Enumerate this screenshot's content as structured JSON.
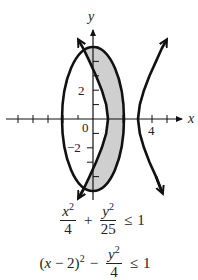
{
  "figure": {
    "axes": {
      "x_label": "x",
      "y_label": "y",
      "origin_label": "0",
      "x_tick_labels": [
        {
          "value": 4,
          "text": "4"
        }
      ],
      "y_tick_labels": [
        {
          "value": 2,
          "text": "2"
        },
        {
          "value": -2,
          "text": "−2"
        }
      ]
    },
    "curves": [
      {
        "name": "ellipse",
        "equation": "x^2/4 + y^2/25 = 1"
      },
      {
        "name": "hyperbola",
        "equation": "(x - 2)^2 - y^2/4 = 1"
      }
    ],
    "shaded_region": {
      "description": "points inside the ellipse and between the hyperbola branches",
      "color": "#cccccc"
    },
    "stroke_color": "#111111"
  },
  "inequalities": {
    "first": {
      "term1_num_base": "x",
      "term1_num_exp": "2",
      "term1_den": "4",
      "op": "+",
      "term2_num_base": "y",
      "term2_num_exp": "2",
      "term2_den": "25",
      "relation": "≤",
      "rhs": "1"
    },
    "second": {
      "term1_open": "(",
      "term1_var": "x",
      "term1_rest": " − 2)",
      "term1_exp": "2",
      "op": "−",
      "term2_num_base": "y",
      "term2_num_exp": "2",
      "term2_den": "4",
      "relation": "≤",
      "rhs": "1"
    }
  }
}
